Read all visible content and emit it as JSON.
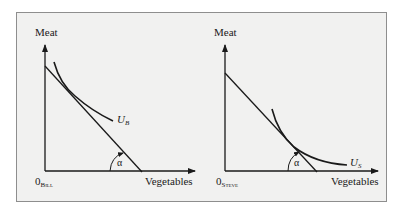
{
  "figure": {
    "colors": {
      "frame_bg": "#f1f1f0",
      "frame_border": "#8e8e8e",
      "ink": "#1a1a1a"
    },
    "panels": [
      {
        "id": "bill",
        "y_axis_label": "Meat",
        "x_axis_label": "Vegetables",
        "origin_label": "0",
        "origin_subscript": "Bill",
        "curve_label": "U",
        "curve_subscript": "B",
        "angle_label": "α"
      },
      {
        "id": "steve",
        "y_axis_label": "Meat",
        "x_axis_label": "Vegetables",
        "origin_label": "0",
        "origin_subscript": "Steve",
        "curve_label": "U",
        "curve_subscript": "S",
        "angle_label": "α"
      }
    ]
  }
}
